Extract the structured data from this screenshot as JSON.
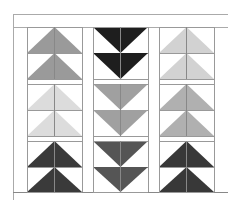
{
  "caption": "",
  "diagram": {
    "frame": {
      "left": 13,
      "top": 14,
      "right": 228,
      "header_bottom": 27,
      "bottom": 192,
      "stroke": "#aaaaaa"
    },
    "columns": [
      {
        "x0": 27,
        "x1": 82,
        "direction": "up",
        "rows": [
          "#9a9a9a",
          "#dcdcdc",
          "#3a3a3a"
        ]
      },
      {
        "x0": 93,
        "x1": 148,
        "direction": "down",
        "rows": [
          "#1e1e1e",
          "#a0a0a0",
          "#555555"
        ]
      },
      {
        "x0": 159,
        "x1": 214,
        "direction": "up",
        "rows": [
          "#d2d2d2",
          "#b0b0b0",
          "#383838"
        ]
      }
    ],
    "rows": [
      {
        "y0": 27,
        "mid": 53,
        "y1": 79,
        "band_end": 84
      },
      {
        "y0": 84,
        "mid": 110,
        "y1": 136,
        "band_end": 141
      },
      {
        "y0": 141,
        "mid": 167,
        "y1": 192,
        "band_end": 192
      }
    ]
  }
}
